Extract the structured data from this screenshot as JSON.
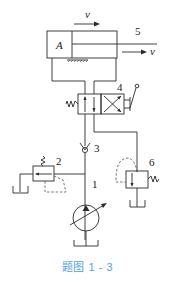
{
  "figure": {
    "caption": "题图 1 - 3",
    "caption_color": "#4fa3d9",
    "components": [
      {
        "id": "1",
        "label": "1",
        "type": "variable-displacement-pump"
      },
      {
        "id": "2",
        "label": "2",
        "type": "relief-valve"
      },
      {
        "id": "3",
        "label": "3",
        "type": "check-valve"
      },
      {
        "id": "4",
        "label": "4",
        "type": "4-way-2-position-manual-directional-valve"
      },
      {
        "id": "5",
        "label": "5",
        "type": "single-rod-hydraulic-cylinder"
      },
      {
        "id": "6",
        "label": "6",
        "type": "sequence-valve"
      }
    ],
    "cylinder_area_label": "A",
    "velocity_label_top": "v",
    "velocity_label_rod": "v"
  }
}
